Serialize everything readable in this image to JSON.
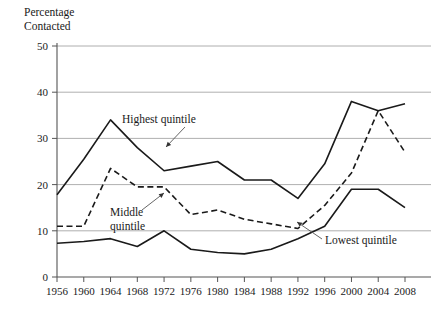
{
  "chart_data": {
    "type": "line",
    "title": "",
    "ylabel": "Percentage\nContacted",
    "xlabel": "",
    "ylim": [
      0,
      50
    ],
    "yticks": [
      0,
      10,
      20,
      30,
      40,
      50
    ],
    "grid": true,
    "legend_position": "inline-annotations",
    "categories": [
      1956,
      1960,
      1964,
      1968,
      1972,
      1976,
      1980,
      1984,
      1988,
      1992,
      1996,
      2000,
      2004,
      2008
    ],
    "xtick_labels": [
      "1956",
      "1960",
      "1964",
      "1968",
      "1972",
      "1976",
      "1980",
      "1984",
      "1988",
      "1992",
      "1996",
      "2000",
      "2004",
      "2008"
    ],
    "series": [
      {
        "name": "Highest quintile",
        "style": "solid",
        "color": "#1a1a1a",
        "values": [
          17.8,
          25.5,
          34.0,
          28.0,
          23.0,
          24.0,
          25.0,
          21.0,
          21.0,
          17.0,
          24.5,
          38.0,
          36.0,
          37.5
        ]
      },
      {
        "name": "Middle quintile",
        "style": "dashed",
        "color": "#1a1a1a",
        "values": [
          11.0,
          11.0,
          23.5,
          19.5,
          19.5,
          13.5,
          14.5,
          12.5,
          11.5,
          10.5,
          15.5,
          22.5,
          36.0,
          27.0
        ]
      },
      {
        "name": "Lowest quintile",
        "style": "solid",
        "color": "#1a1a1a",
        "values": [
          7.3,
          7.7,
          8.3,
          6.6,
          10.0,
          6.0,
          5.3,
          5.0,
          6.0,
          8.3,
          11.0,
          19.0,
          19.0,
          15.0
        ]
      }
    ],
    "annotations": [
      {
        "label": "Highest quintile",
        "text_x": 122,
        "text_y": 123,
        "leader": [
          [
            185,
            127
          ],
          [
            166,
            147
          ]
        ]
      },
      {
        "label": "Middle\nquintile",
        "text_x": 110,
        "text_y": 216,
        "leader": [
          [
            142,
            210
          ],
          [
            164,
            193
          ]
        ]
      },
      {
        "label": "Lowest quintile",
        "text_x": 325,
        "text_y": 244,
        "leader": [
          [
            322,
            239
          ],
          [
            297,
            222
          ]
        ]
      }
    ],
    "axis_colors": {
      "grid": "#9a9a9a",
      "axis": "#555555",
      "line": "#1a1a1a"
    }
  }
}
